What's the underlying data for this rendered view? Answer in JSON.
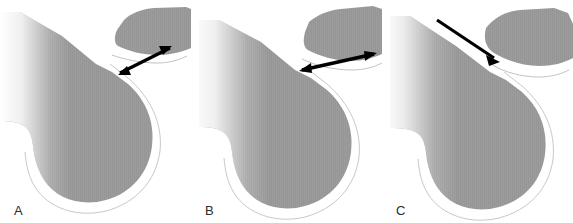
{
  "figure": {
    "type": "anatomical-diagram",
    "width": 573,
    "height": 223,
    "background_color": "#ffffff",
    "panel_count": 3
  },
  "colors": {
    "bone_fill": "#9c9c9c",
    "bone_fill_light": "#a8a8a8",
    "bone_texture_line": "#929292",
    "cartilage_fill": "#ffffff",
    "cartilage_outline": "#b9b9b9",
    "arrow_color": "#000000",
    "label_color": "#2b2b2b",
    "fade_color": "#ffffff"
  },
  "panels": [
    {
      "id": "panel-a",
      "label": "A",
      "x": 0,
      "structures": [
        {
          "name": "femur",
          "kind": "bone"
        },
        {
          "name": "femoral-cartilage",
          "kind": "cartilage"
        },
        {
          "name": "patella",
          "kind": "bone"
        },
        {
          "name": "patellar-cartilage",
          "kind": "cartilage"
        }
      ],
      "arrow": {
        "name": "contact-area-arrow",
        "style": "double-headed",
        "heads": 2,
        "orientation": "oblique",
        "from": [
          118,
          75
        ],
        "to": [
          172,
          47
        ]
      }
    },
    {
      "id": "panel-b",
      "label": "B",
      "x": 191,
      "structures": [
        {
          "name": "femur",
          "kind": "bone"
        },
        {
          "name": "femoral-cartilage",
          "kind": "cartilage"
        },
        {
          "name": "patella",
          "kind": "bone"
        },
        {
          "name": "patellar-cartilage",
          "kind": "cartilage"
        }
      ],
      "arrow": {
        "name": "contact-area-arrow",
        "style": "double-headed",
        "heads": 2,
        "orientation": "near-horizontal",
        "from": [
          109,
          72
        ],
        "to": [
          185,
          53
        ]
      }
    },
    {
      "id": "panel-c",
      "label": "C",
      "x": 382,
      "structures": [
        {
          "name": "femur",
          "kind": "bone"
        },
        {
          "name": "femoral-cartilage",
          "kind": "cartilage"
        },
        {
          "name": "patella",
          "kind": "bone"
        },
        {
          "name": "patellar-cartilage",
          "kind": "cartilage"
        }
      ],
      "arrow": {
        "name": "patellar-translation-arrow",
        "style": "single-headed",
        "heads": 1,
        "orientation": "oblique-descending",
        "from": [
          58,
          22
        ],
        "to": [
          118,
          62
        ]
      }
    }
  ]
}
